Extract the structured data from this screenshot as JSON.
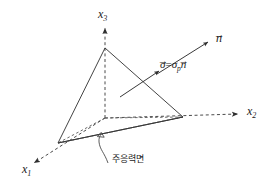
{
  "figure": {
    "colors": {
      "stroke": "#3a3a3a",
      "dashed": "#4a4a4a",
      "text": "#1a1a1a",
      "background": "#ffffff"
    },
    "axes": [
      {
        "name": "x1",
        "label_base": "x",
        "label_sub": "1",
        "x": 22,
        "y": 170
      },
      {
        "name": "x2",
        "label_base": "x",
        "label_sub": "2",
        "x": 247,
        "y": 112
      },
      {
        "name": "x3",
        "label_base": "x",
        "label_sub": "3",
        "x": 98,
        "y": 9
      }
    ],
    "vectors": [
      {
        "name": "normal-vector",
        "label_base": "n",
        "overbar": "→",
        "x": 216,
        "y": 37
      }
    ],
    "equations": [
      {
        "name": "traction-equation",
        "lhs_base": "σ",
        "operator": "=",
        "rhs_base": "σ",
        "rhs_sub": "p",
        "rhs_factor": "n",
        "x": 160,
        "y": 63
      }
    ],
    "annotations": [
      {
        "name": "principal-plane-annotation",
        "text": "주응력면",
        "x": 112,
        "y": 158
      }
    ],
    "geometry": {
      "origin": {
        "x": 105,
        "y": 118
      },
      "apex_x3": {
        "x": 105,
        "y": 48
      },
      "vertex_x1": {
        "x": 58,
        "y": 143
      },
      "vertex_x2": {
        "x": 183,
        "y": 117
      }
    }
  }
}
